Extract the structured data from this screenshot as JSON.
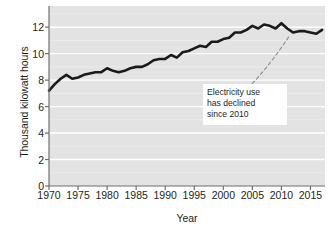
{
  "chart_data": {
    "type": "line",
    "title": "",
    "xlabel": "Year",
    "ylabel": "Thousand kilowatt hours",
    "xlim": [
      1970,
      2017.5
    ],
    "ylim": [
      0,
      13.6
    ],
    "grid": true,
    "grid_orientation": "horizontal",
    "legend": "none",
    "x_ticks": [
      1970,
      1975,
      1980,
      1985,
      1990,
      1995,
      2000,
      2005,
      2010,
      2015
    ],
    "x_tick_labels": [
      "1970",
      "1975",
      "1980",
      "1985",
      "1990",
      "1995",
      "2000",
      "2005",
      "2010",
      "2015"
    ],
    "y_ticks": [
      0,
      2,
      4,
      6,
      8,
      10,
      12
    ],
    "y_tick_labels": [
      "0",
      "2",
      "4",
      "6",
      "8",
      "10",
      "12"
    ],
    "series": [
      {
        "name": "Average residential electricity use",
        "color": "#1a1a1a",
        "x": [
          1970,
          1971,
          1972,
          1973,
          1974,
          1975,
          1976,
          1977,
          1978,
          1979,
          1980,
          1981,
          1982,
          1983,
          1984,
          1985,
          1986,
          1987,
          1988,
          1989,
          1990,
          1991,
          1992,
          1993,
          1994,
          1995,
          1996,
          1997,
          1998,
          1999,
          2000,
          2001,
          2002,
          2003,
          2004,
          2005,
          2006,
          2007,
          2008,
          2009,
          2010,
          2011,
          2012,
          2013,
          2014,
          2015,
          2016,
          2017
        ],
        "values": [
          7.2,
          7.7,
          8.1,
          8.4,
          8.1,
          8.2,
          8.4,
          8.5,
          8.6,
          8.6,
          8.9,
          8.7,
          8.6,
          8.7,
          8.9,
          9.0,
          9.0,
          9.2,
          9.5,
          9.6,
          9.6,
          9.9,
          9.7,
          10.1,
          10.2,
          10.4,
          10.6,
          10.5,
          10.9,
          10.9,
          11.1,
          11.2,
          11.6,
          11.6,
          11.8,
          12.1,
          11.9,
          12.2,
          12.1,
          11.9,
          12.3,
          11.9,
          11.6,
          11.7,
          11.7,
          11.6,
          11.5,
          11.8
        ]
      }
    ],
    "annotations": [
      {
        "text_lines": [
          "Electricity use",
          "has declined",
          "since 2010"
        ],
        "full_text": "Electricity use has declined since 2010",
        "points_to_year": 2014,
        "style": "dashed-leader"
      }
    ]
  }
}
